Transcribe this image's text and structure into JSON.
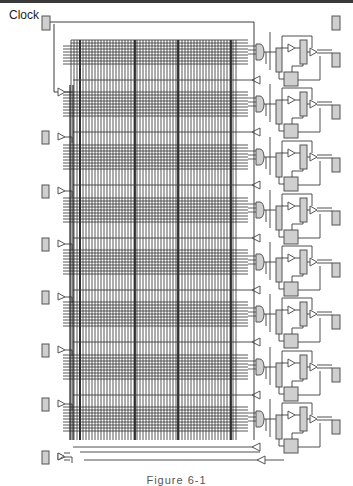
{
  "diagram": {
    "clock_label": "Clock",
    "caption": "Figure 6-1",
    "colors": {
      "line": "#3c3c3c",
      "grid_line": "#2e2e2e",
      "block_fill": "#cfcfcf",
      "block_stroke": "#555555",
      "background": "#ffffff"
    },
    "clock_pad": {
      "x": 42,
      "y": 16,
      "w": 8,
      "h": 14
    },
    "top_right_pad": {
      "x": 332,
      "y": 16,
      "w": 8,
      "h": 14
    },
    "left_pads_y": [
      137,
      191,
      244,
      297,
      350,
      404,
      457
    ],
    "right_pads_y": [
      60,
      112,
      165,
      218,
      270,
      322,
      375,
      427
    ],
    "logic_rows_y": [
      50,
      102,
      155,
      208,
      260,
      312,
      365,
      417
    ],
    "grid": {
      "x0": 63,
      "x1": 248,
      "y0": 40,
      "y1": 440
    },
    "heavy_columns_x": [
      80,
      135,
      178,
      231
    ],
    "bottom_bus": {
      "y1": 452,
      "y2": 460,
      "x0": 75,
      "x1": 255
    }
  }
}
